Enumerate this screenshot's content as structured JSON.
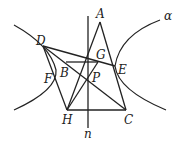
{
  "figure": {
    "labels": {
      "A": "A",
      "B": "B",
      "C": "C",
      "D": "D",
      "E": "E",
      "F": "F",
      "G": "G",
      "H": "H",
      "P": "P",
      "n": "n",
      "alpha": "α"
    },
    "points": {
      "A": [
        100,
        22
      ],
      "B": [
        66,
        64
      ],
      "C": [
        126,
        110
      ],
      "D": [
        43,
        46
      ],
      "E": [
        115,
        66
      ],
      "F": [
        56,
        78
      ],
      "G": [
        98,
        62
      ],
      "H": [
        67,
        110
      ],
      "P": [
        88,
        80
      ]
    },
    "line_n": {
      "x": 88,
      "y1": 16,
      "y2": 128
    }
  }
}
